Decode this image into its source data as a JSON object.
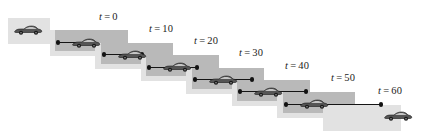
{
  "figure": {
    "width": 427,
    "height": 134,
    "background": "#ffffff",
    "panel_light_color": "#e2e2e2",
    "panel_dark_color": "#b9b9b9",
    "line_color": "#141414",
    "marker_color": "#121212",
    "car_body_color": "#555555",
    "car_outline_color": "#1a1a1a",
    "label_color": "#1b1b1b"
  },
  "labels": [
    {
      "id": "t0",
      "text": "t = 0",
      "var": "t",
      "eq": "=",
      "value": "0",
      "x": 99,
      "y": 11
    },
    {
      "id": "t10",
      "text": "t = 10",
      "var": "t",
      "eq": "=",
      "value": "10",
      "x": 149,
      "y": 23
    },
    {
      "id": "t20",
      "text": "t = 20",
      "var": "t",
      "eq": "=",
      "value": "20",
      "x": 194,
      "y": 35
    },
    {
      "id": "t30",
      "text": "t = 30",
      "var": "t",
      "eq": "=",
      "value": "30",
      "x": 239,
      "y": 47
    },
    {
      "id": "t40",
      "text": "t = 40",
      "var": "t",
      "eq": "=",
      "value": "40",
      "x": 285,
      "y": 60
    },
    {
      "id": "t50",
      "text": "t = 50",
      "var": "t",
      "eq": "=",
      "value": "50",
      "x": 331,
      "y": 72
    },
    {
      "id": "t60",
      "text": "t = 60",
      "var": "t",
      "eq": "=",
      "value": "60",
      "x": 378,
      "y": 85
    }
  ],
  "panels": [
    {
      "id": "panel-start",
      "shade": "light",
      "x": 8,
      "y": 18,
      "w": 42,
      "h": 26
    },
    {
      "id": "panel-t0-light",
      "shade": "light",
      "x": 50,
      "y": 30,
      "w": 78,
      "h": 26
    },
    {
      "id": "panel-t0-dark",
      "shade": "dark",
      "x": 55,
      "y": 30,
      "w": 73,
      "h": 21
    },
    {
      "id": "panel-t10-light",
      "shade": "light",
      "x": 95,
      "y": 43,
      "w": 78,
      "h": 26
    },
    {
      "id": "panel-t10-dark",
      "shade": "dark",
      "x": 101,
      "y": 43,
      "w": 72,
      "h": 21
    },
    {
      "id": "panel-t20-light",
      "shade": "light",
      "x": 141,
      "y": 55,
      "w": 78,
      "h": 26
    },
    {
      "id": "panel-t20-dark",
      "shade": "dark",
      "x": 146,
      "y": 55,
      "w": 73,
      "h": 21
    },
    {
      "id": "panel-t30-light",
      "shade": "light",
      "x": 186,
      "y": 68,
      "w": 78,
      "h": 26
    },
    {
      "id": "panel-t30-dark",
      "shade": "dark",
      "x": 192,
      "y": 68,
      "w": 72,
      "h": 21
    },
    {
      "id": "panel-t40-light",
      "shade": "light",
      "x": 232,
      "y": 80,
      "w": 78,
      "h": 26
    },
    {
      "id": "panel-t40-dark",
      "shade": "dark",
      "x": 237,
      "y": 80,
      "w": 73,
      "h": 21
    },
    {
      "id": "panel-t50-light",
      "shade": "light",
      "x": 277,
      "y": 92,
      "w": 78,
      "h": 26
    },
    {
      "id": "panel-t50-dark",
      "shade": "dark",
      "x": 283,
      "y": 92,
      "w": 72,
      "h": 21
    },
    {
      "id": "panel-t60-light",
      "shade": "light",
      "x": 323,
      "y": 105,
      "w": 78,
      "h": 26
    }
  ],
  "cars": [
    {
      "id": "car-initial",
      "x": 13,
      "y": 24
    },
    {
      "id": "car-t0",
      "x": 71,
      "y": 37
    },
    {
      "id": "car-t10",
      "x": 117,
      "y": 49
    },
    {
      "id": "car-t20",
      "x": 162,
      "y": 61
    },
    {
      "id": "car-t30",
      "x": 208,
      "y": 74
    },
    {
      "id": "car-t40",
      "x": 253,
      "y": 86
    },
    {
      "id": "car-t50",
      "x": 299,
      "y": 98
    },
    {
      "id": "car-t60",
      "x": 383,
      "y": 110
    }
  ],
  "vectors": [
    {
      "id": "vec-t0",
      "x": 58,
      "y": 42,
      "w": 29,
      "start_dot": true,
      "end_dot": true
    },
    {
      "id": "vec-t10",
      "x": 104,
      "y": 54,
      "w": 38,
      "start_dot": true,
      "end_dot": true
    },
    {
      "id": "vec-t20",
      "x": 149,
      "y": 67,
      "w": 48,
      "start_dot": true,
      "end_dot": true
    },
    {
      "id": "vec-t30",
      "x": 195,
      "y": 79,
      "w": 57,
      "start_dot": true,
      "end_dot": true
    },
    {
      "id": "vec-t40",
      "x": 240,
      "y": 91,
      "w": 66,
      "start_dot": true,
      "end_dot": true
    },
    {
      "id": "vec-t50",
      "x": 286,
      "y": 104,
      "w": 95,
      "start_dot": true,
      "end_dot": true
    }
  ]
}
